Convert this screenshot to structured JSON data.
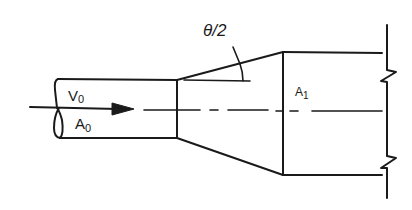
{
  "diagram": {
    "type": "pipe-expansion-conical-diffuser",
    "labels": {
      "velocity_inlet": "V",
      "velocity_inlet_sub": "0",
      "area_inlet": "A",
      "area_inlet_sub": "0",
      "area_outlet": "A",
      "area_outlet_sub": "1",
      "angle": "θ/2"
    },
    "elements": [
      {
        "id": "inlet-pipe",
        "description": "small diameter pipe with cut end"
      },
      {
        "id": "flow-arrow",
        "description": "arrow indicating flow direction along centerline"
      },
      {
        "id": "conical-diffuser",
        "description": "gradual expansion section"
      },
      {
        "id": "outlet-pipe",
        "description": "large diameter pipe with break line"
      },
      {
        "id": "centerline",
        "description": "dash-dot axis line"
      },
      {
        "id": "half-angle-mark",
        "description": "half cone angle indicator"
      }
    ],
    "colors": {
      "line": "#1a1a1a",
      "background": "#ffffff"
    }
  }
}
